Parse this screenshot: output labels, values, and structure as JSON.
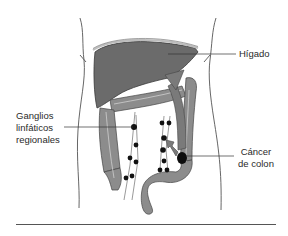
{
  "figure": {
    "labels": {
      "liver": "Hígado",
      "lymph_nodes_line1": "Ganglios",
      "lymph_nodes_line2": "linfáticos",
      "lymph_nodes_line3": "regionales",
      "cancer_line1": "Cáncer",
      "cancer_line2": "de colon"
    },
    "colors": {
      "organ_fill": "#6e6e6e",
      "colon_fill": "#8c8c8c",
      "arrow_fill": "#7a7a7a",
      "node_fill": "#111111",
      "outline": "#444444",
      "background": "#ffffff"
    },
    "elements": [
      "body-outline",
      "liver",
      "colon",
      "lymph-nodes",
      "tumor",
      "metastasis-arrow-to-liver",
      "spread-arrow-to-nodes"
    ]
  }
}
